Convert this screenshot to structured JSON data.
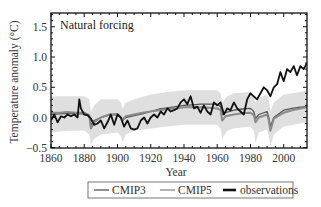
{
  "chart_data": {
    "type": "line",
    "title": "",
    "annotation": "Natural forcing",
    "xlabel": "Year",
    "ylabel": "Temperature anomaly (°C)",
    "xlim": [
      1860,
      2014
    ],
    "ylim": [
      -0.5,
      1.75
    ],
    "xticks": [
      1860,
      1880,
      1900,
      1920,
      1940,
      1960,
      1980,
      2000
    ],
    "xtick_labels": [
      "1860",
      "1880",
      "1900",
      "1920",
      "1940",
      "1960",
      "1980",
      "2000"
    ],
    "yticks": [
      -0.5,
      0.0,
      0.5,
      1.0,
      1.5
    ],
    "ytick_labels": [
      "−0.5",
      "0.0",
      "0.5",
      "1.0",
      "1.5"
    ],
    "grid": false,
    "legend_position": "bottom-outside",
    "legend": [
      "CMIP3",
      "CMIP5",
      "observations"
    ],
    "series": [
      {
        "name": "CMIP3",
        "color": "#555555",
        "style": "thin multi-model mean with light-grey ensemble spread",
        "x": [
          1860,
          1865,
          1870,
          1875,
          1880,
          1883,
          1884,
          1886,
          1890,
          1895,
          1900,
          1902,
          1903,
          1905,
          1910,
          1915,
          1920,
          1925,
          1930,
          1935,
          1940,
          1945,
          1950,
          1955,
          1960,
          1962,
          1963,
          1965,
          1970,
          1975,
          1980,
          1982,
          1983,
          1985,
          1990,
          1991,
          1992,
          1994,
          2000,
          2005,
          2010,
          2014
        ],
        "values": [
          0.05,
          0.06,
          0.07,
          0.06,
          0.06,
          0.02,
          -0.12,
          -0.05,
          0.0,
          0.04,
          0.05,
          0.0,
          -0.05,
          0.0,
          0.03,
          0.06,
          0.1,
          0.14,
          0.16,
          0.18,
          0.2,
          0.21,
          0.22,
          0.22,
          0.22,
          0.18,
          0.05,
          0.08,
          0.12,
          0.14,
          0.15,
          0.1,
          -0.02,
          0.05,
          0.1,
          0.0,
          -0.15,
          0.0,
          0.12,
          0.15,
          0.17,
          0.18
        ]
      },
      {
        "name": "CMIP5",
        "color": "#8a8a8a",
        "style": "thick grey multi-model mean with light-grey ensemble spread",
        "x": [
          1860,
          1865,
          1870,
          1875,
          1880,
          1883,
          1884,
          1886,
          1890,
          1895,
          1900,
          1902,
          1903,
          1905,
          1910,
          1915,
          1920,
          1925,
          1930,
          1935,
          1940,
          1945,
          1950,
          1955,
          1960,
          1962,
          1963,
          1965,
          1970,
          1975,
          1980,
          1982,
          1983,
          1985,
          1990,
          1991,
          1992,
          1994,
          2000,
          2005,
          2010,
          2014
        ],
        "values": [
          0.08,
          0.08,
          0.09,
          0.08,
          0.08,
          0.04,
          -0.18,
          -0.08,
          0.0,
          0.05,
          0.06,
          0.0,
          -0.04,
          0.02,
          0.05,
          0.08,
          0.1,
          0.12,
          0.14,
          0.15,
          0.17,
          0.17,
          0.17,
          0.16,
          0.15,
          0.12,
          -0.05,
          0.02,
          0.05,
          0.07,
          0.08,
          0.04,
          -0.08,
          0.0,
          0.05,
          -0.05,
          -0.22,
          -0.02,
          0.08,
          0.12,
          0.15,
          0.17
        ]
      },
      {
        "name": "observations",
        "color": "#111111",
        "style": "thick black line",
        "x": [
          1860,
          1862,
          1864,
          1866,
          1868,
          1870,
          1872,
          1874,
          1876,
          1877,
          1878,
          1880,
          1882,
          1884,
          1886,
          1888,
          1890,
          1892,
          1894,
          1896,
          1898,
          1900,
          1902,
          1904,
          1906,
          1908,
          1910,
          1912,
          1914,
          1916,
          1918,
          1920,
          1922,
          1924,
          1926,
          1928,
          1930,
          1932,
          1934,
          1936,
          1938,
          1940,
          1942,
          1944,
          1946,
          1948,
          1950,
          1952,
          1954,
          1956,
          1958,
          1960,
          1962,
          1964,
          1966,
          1968,
          1970,
          1972,
          1974,
          1976,
          1978,
          1980,
          1982,
          1984,
          1986,
          1988,
          1990,
          1992,
          1994,
          1996,
          1998,
          2000,
          2002,
          2004,
          2006,
          2008,
          2010,
          2012,
          2014
        ],
        "values": [
          -0.05,
          0.05,
          -0.08,
          0.02,
          0.0,
          0.05,
          0.02,
          0.05,
          0.0,
          0.3,
          0.15,
          0.05,
          0.04,
          -0.02,
          -0.12,
          -0.1,
          -0.05,
          -0.18,
          -0.08,
          0.05,
          -0.12,
          0.05,
          0.0,
          -0.15,
          -0.05,
          -0.18,
          -0.2,
          -0.18,
          -0.05,
          0.0,
          -0.1,
          0.0,
          0.05,
          0.0,
          0.1,
          0.05,
          0.15,
          0.1,
          0.12,
          0.15,
          0.25,
          0.3,
          0.22,
          0.35,
          0.15,
          0.18,
          0.08,
          0.2,
          0.1,
          0.05,
          0.25,
          0.2,
          0.25,
          0.05,
          0.15,
          0.12,
          0.25,
          0.15,
          0.1,
          0.05,
          0.3,
          0.4,
          0.35,
          0.3,
          0.4,
          0.5,
          0.45,
          0.35,
          0.5,
          0.55,
          0.75,
          0.6,
          0.8,
          0.75,
          0.85,
          0.7,
          0.85,
          0.8,
          0.9
        ]
      }
    ],
    "ensemble_spread": {
      "color": "#d9d9d9",
      "x": [
        1860,
        1870,
        1880,
        1883,
        1884,
        1886,
        1890,
        1900,
        1902,
        1903,
        1905,
        1910,
        1920,
        1930,
        1940,
        1950,
        1960,
        1962,
        1963,
        1966,
        1970,
        1980,
        1982,
        1983,
        1985,
        1990,
        1991,
        1992,
        1994,
        2000,
        2010,
        2014
      ],
      "upper": [
        0.35,
        0.35,
        0.35,
        0.3,
        0.1,
        0.2,
        0.3,
        0.3,
        0.25,
        0.15,
        0.25,
        0.3,
        0.38,
        0.42,
        0.45,
        0.45,
        0.45,
        0.4,
        0.25,
        0.35,
        0.4,
        0.42,
        0.35,
        0.25,
        0.32,
        0.38,
        0.3,
        0.1,
        0.25,
        0.38,
        0.42,
        0.45
      ],
      "lower": [
        -0.25,
        -0.22,
        -0.22,
        -0.28,
        -0.45,
        -0.35,
        -0.28,
        -0.25,
        -0.3,
        -0.4,
        -0.28,
        -0.22,
        -0.18,
        -0.15,
        -0.12,
        -0.12,
        -0.12,
        -0.18,
        -0.35,
        -0.22,
        -0.18,
        -0.15,
        -0.22,
        -0.42,
        -0.25,
        -0.2,
        -0.32,
        -0.48,
        -0.28,
        -0.15,
        -0.1,
        -0.08
      ]
    }
  }
}
